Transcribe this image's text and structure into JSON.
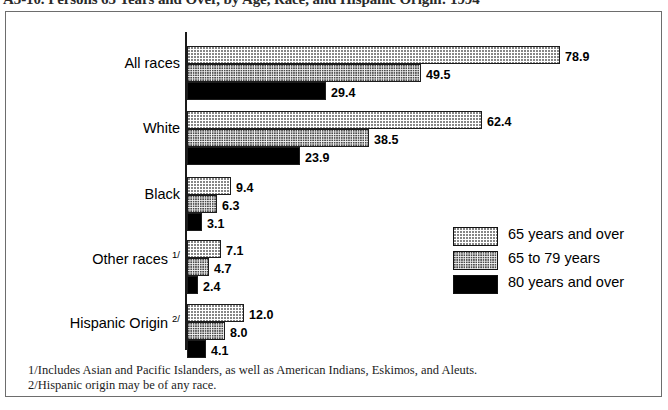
{
  "title": "A3-10. Persons 65 Years and Over, by Age, Race, and Hispanic Origin: 1994",
  "chart_data": {
    "type": "bar",
    "orientation": "horizontal",
    "title": "A3-10. Persons 65 Years and Over, by Age, Race, and Hispanic Origin: 1994",
    "xlabel": "",
    "ylabel": "",
    "xlim": [
      0,
      78.9
    ],
    "grid": false,
    "legend_position": "middle-right",
    "categories": [
      "All races",
      "White",
      "Black",
      "Other races",
      "Hispanic Origin"
    ],
    "category_footnotes": [
      "",
      "",
      "",
      "1/",
      "2/"
    ],
    "series": [
      {
        "name": "65 years and over",
        "pattern": "light-dot",
        "values": [
          78.9,
          62.4,
          9.4,
          7.1,
          12.0
        ]
      },
      {
        "name": "65 to 79 years",
        "pattern": "dense-dot",
        "values": [
          49.5,
          38.5,
          6.3,
          4.7,
          8.0
        ]
      },
      {
        "name": "80 years and over",
        "pattern": "solid-black",
        "values": [
          29.4,
          23.9,
          3.1,
          2.4,
          4.1
        ]
      }
    ],
    "value_labels": [
      [
        "78.9",
        "49.5",
        "29.4"
      ],
      [
        "62.4",
        "38.5",
        "23.9"
      ],
      [
        "9.4",
        "6.3",
        "3.1"
      ],
      [
        "7.1",
        "4.7",
        "2.4"
      ],
      [
        "12.0",
        "8.0",
        "4.1"
      ]
    ]
  },
  "legend": {
    "items": [
      {
        "label": "65 years and over",
        "pattern": "light-dot"
      },
      {
        "label": "65 to 79 years",
        "pattern": "dense-dot"
      },
      {
        "label": "80 years and over",
        "pattern": "solid-black"
      }
    ]
  },
  "footnotes": [
    "1/Includes Asian and Pacific Islanders, as well as American Indians, Eskimos, and Aleuts.",
    "2/Hispanic origin may be of any race."
  ],
  "colors": {
    "axis": "#1a1a1a",
    "border": "#6d6d6d",
    "bar_outline": "#1c1c1c",
    "solid_fill": "#000000",
    "background": "#ffffff"
  }
}
